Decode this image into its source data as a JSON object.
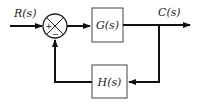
{
  "diagram": {
    "type": "feedback-control-block-diagram",
    "input_label": "R(s)",
    "output_label": "C(s)",
    "forward_block": "G(s)",
    "feedback_block": "H(s)",
    "summing_junction": {
      "plus_sign": "+",
      "minus_sign": "−"
    },
    "colors": {
      "line": "#111111",
      "box": "#333333",
      "text": "#222222"
    }
  }
}
